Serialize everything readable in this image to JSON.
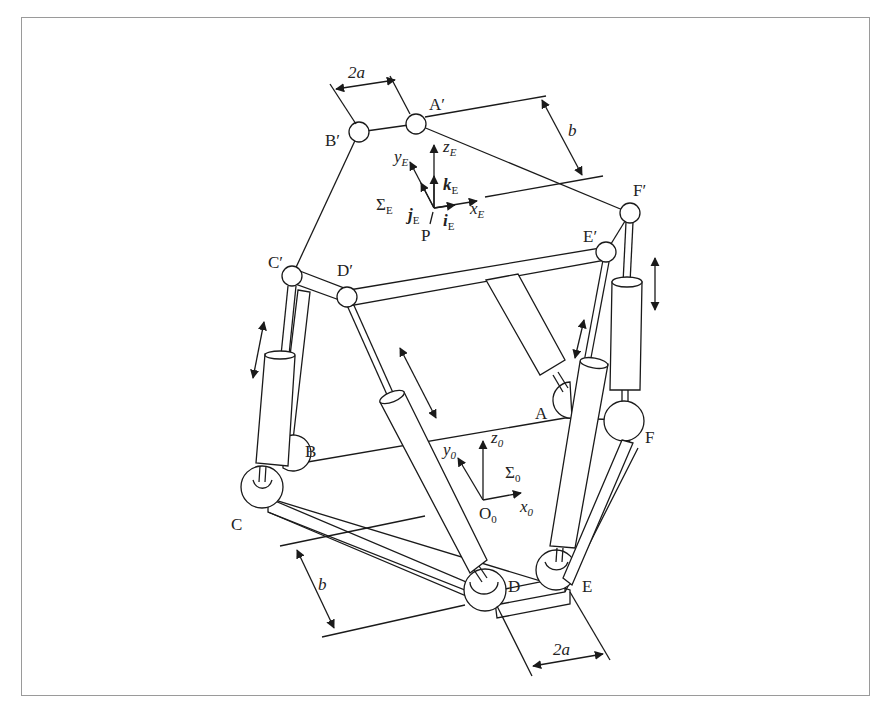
{
  "figure": {
    "colors": {
      "line": "#1a1a1a",
      "frame": "#9a9a9a",
      "background": "#ffffff"
    }
  },
  "labels": {
    "top_joints": {
      "A": "A′",
      "B": "B′",
      "C": "C′",
      "D": "D′",
      "E": "E′",
      "F": "F′"
    },
    "base_joints": {
      "A": "A",
      "B": "B",
      "C": "C",
      "D": "D",
      "E": "E",
      "F": "F"
    },
    "end_effector_frame": {
      "sigma": "Σ",
      "sigma_sub": "E",
      "origin": "P",
      "x": "x",
      "x_sub": "E",
      "y": "y",
      "y_sub": "E",
      "z": "z",
      "z_sub": "E",
      "i": "i",
      "i_sub": "E",
      "j": "j",
      "j_sub": "E",
      "k": "k",
      "k_sub": "E"
    },
    "base_frame": {
      "sigma": "Σ",
      "sigma_sub": "0",
      "origin": "O",
      "origin_sub": "0",
      "x": "x",
      "x_sub": "0",
      "y": "y",
      "y_sub": "0",
      "z": "z",
      "z_sub": "0"
    },
    "dimensions": {
      "top_2a": "2a",
      "top_b": "b",
      "base_b": "b",
      "base_2a": "2a"
    }
  }
}
